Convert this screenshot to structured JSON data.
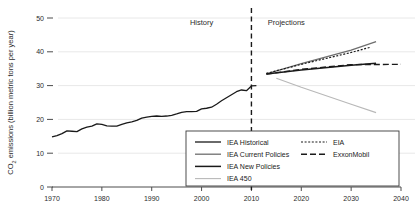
{
  "chart_data": {
    "type": "line",
    "title": "",
    "xlabel": "",
    "ylabel": "CO2 emissions (billion metric tons per year)",
    "ylabel_prefix": "CO",
    "ylabel_sub": "2",
    "ylabel_rest": " emissions (billion metric tons per year)",
    "xlim": [
      1970,
      2040
    ],
    "ylim": [
      0,
      50
    ],
    "xticks": [
      1970,
      1980,
      1990,
      2000,
      2010,
      2020,
      2030,
      2040
    ],
    "yticks": [
      0,
      10,
      20,
      30,
      40,
      50
    ],
    "grid": "horizontal",
    "legend_position": "bottom-right-inside",
    "annotations": [
      {
        "name": "history-label",
        "text": "History",
        "x": 2000,
        "y": 48
      },
      {
        "name": "projections-label",
        "text": "Projections",
        "x": 2017,
        "y": 48
      },
      {
        "name": "history-projection-divider",
        "text": "",
        "x": 2010,
        "style": "dashed-vertical"
      }
    ],
    "series": [
      {
        "name": "IEA Historical",
        "key": "iea_historical",
        "color": "#1a1a1a",
        "dash": "none",
        "width": 1.3,
        "points": [
          [
            1970,
            14.8
          ],
          [
            1971,
            15.2
          ],
          [
            1972,
            15.8
          ],
          [
            1973,
            16.6
          ],
          [
            1974,
            16.5
          ],
          [
            1975,
            16.4
          ],
          [
            1976,
            17.2
          ],
          [
            1977,
            17.7
          ],
          [
            1978,
            18.0
          ],
          [
            1979,
            18.7
          ],
          [
            1980,
            18.5
          ],
          [
            1981,
            18.1
          ],
          [
            1982,
            18.0
          ],
          [
            1983,
            18.0
          ],
          [
            1984,
            18.5
          ],
          [
            1985,
            19.0
          ],
          [
            1986,
            19.3
          ],
          [
            1987,
            19.7
          ],
          [
            1988,
            20.4
          ],
          [
            1989,
            20.7
          ],
          [
            1990,
            20.9
          ],
          [
            1991,
            21.0
          ],
          [
            1992,
            20.9
          ],
          [
            1993,
            21.0
          ],
          [
            1994,
            21.2
          ],
          [
            1995,
            21.6
          ],
          [
            1996,
            22.1
          ],
          [
            1997,
            22.3
          ],
          [
            1998,
            22.3
          ],
          [
            1999,
            22.4
          ],
          [
            2000,
            23.1
          ],
          [
            2001,
            23.3
          ],
          [
            2002,
            23.6
          ],
          [
            2003,
            24.5
          ],
          [
            2004,
            25.5
          ],
          [
            2005,
            26.4
          ],
          [
            2006,
            27.3
          ],
          [
            2007,
            28.2
          ],
          [
            2008,
            28.7
          ],
          [
            2009,
            28.5
          ],
          [
            2010,
            29.9
          ],
          [
            2011,
            30.0
          ]
        ]
      },
      {
        "name": "IEA Current Policies",
        "key": "iea_current_policies",
        "color": "#6e6e6e",
        "dash": "none",
        "width": 1.3,
        "points": [
          [
            2013,
            33.5
          ],
          [
            2020,
            36.5
          ],
          [
            2030,
            40.5
          ],
          [
            2035,
            43.0
          ]
        ]
      },
      {
        "name": "IEA New Policies",
        "key": "iea_new_policies",
        "color": "#1a1a1a",
        "dash": "none",
        "width": 1.5,
        "points": [
          [
            2013,
            33.4
          ],
          [
            2020,
            34.6
          ],
          [
            2030,
            36.0
          ],
          [
            2035,
            36.6
          ]
        ]
      },
      {
        "name": "IEA 450",
        "key": "iea_450",
        "color": "#b8b8b8",
        "dash": "none",
        "width": 1.1,
        "points": [
          [
            2015,
            32.2
          ],
          [
            2020,
            29.5
          ],
          [
            2030,
            24.5
          ],
          [
            2035,
            22.0
          ]
        ]
      },
      {
        "name": "EIA",
        "key": "eia",
        "color": "#1a1a1a",
        "dash": "2,1.6",
        "width": 1.2,
        "points": [
          [
            2013,
            33.6
          ],
          [
            2020,
            36.3
          ],
          [
            2030,
            39.8
          ],
          [
            2034,
            41.4
          ]
        ]
      },
      {
        "name": "ExxonMobil",
        "key": "exxonmobil",
        "color": "#1a1a1a",
        "dash": "6,3",
        "width": 1.4,
        "points": [
          [
            2013,
            33.4
          ],
          [
            2020,
            34.8
          ],
          [
            2030,
            36.2
          ],
          [
            2040,
            36.3
          ]
        ]
      }
    ],
    "legend": {
      "left_column": [
        {
          "label": "IEA Historical",
          "key": "iea_historical"
        },
        {
          "label": "IEA Current Policies",
          "key": "iea_current_policies"
        },
        {
          "label": "IEA New Policies",
          "key": "iea_new_policies"
        },
        {
          "label": "IEA 450",
          "key": "iea_450"
        }
      ],
      "right_column": [
        {
          "label": "EIA",
          "key": "eia"
        },
        {
          "label": "ExxonMobil",
          "key": "exxonmobil"
        }
      ]
    }
  }
}
